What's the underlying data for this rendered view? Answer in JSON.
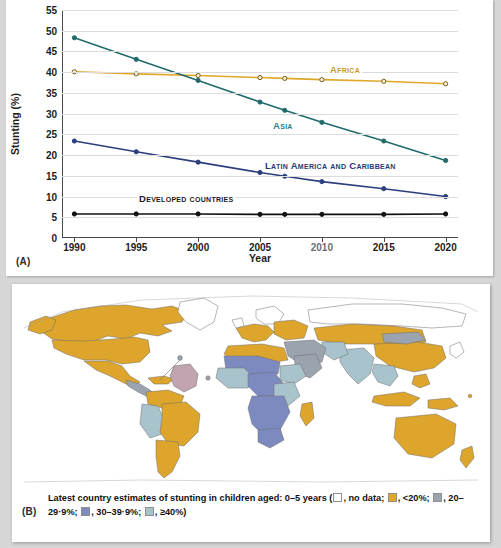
{
  "panel_a": {
    "tag": "(A)",
    "chart_data": {
      "type": "line",
      "title": "",
      "xlabel": "Year",
      "ylabel": "Stunting (%)",
      "x": [
        1990,
        1995,
        2000,
        2005,
        2007,
        2010,
        2015,
        2020
      ],
      "xtick_labels": [
        "1990",
        "1995",
        "2000",
        "2005",
        "2010",
        "2015",
        "2020"
      ],
      "xticks": [
        1990,
        1995,
        2000,
        2005,
        2010,
        2015,
        2020
      ],
      "ytick_labels": [
        "0",
        "5",
        "10",
        "15",
        "20",
        "25",
        "30",
        "35",
        "40",
        "45",
        "50",
        "55"
      ],
      "yticks": [
        0,
        5,
        10,
        15,
        20,
        25,
        30,
        35,
        40,
        45,
        50,
        55
      ],
      "ylim": [
        0,
        55
      ],
      "xlim": [
        1989,
        2021
      ],
      "grid": true,
      "legend": "inline-labels",
      "series": [
        {
          "name": "Africa",
          "color": "#e0a828",
          "label_color": "#c79a28",
          "values": [
            40.1,
            39.6,
            39.2,
            38.7,
            38.5,
            38.2,
            37.8,
            37.2
          ]
        },
        {
          "name": "Asia",
          "color": "#1f6b6b",
          "label_color": "#2d7f86",
          "values": [
            48.3,
            43.1,
            38.0,
            32.8,
            30.8,
            27.9,
            23.4,
            18.7
          ]
        },
        {
          "name": "Latin America and Caribbean",
          "color": "#2b3f7e",
          "label_color": "#273b73",
          "values": [
            23.4,
            20.8,
            18.3,
            15.8,
            14.9,
            13.6,
            11.9,
            10.0
          ]
        },
        {
          "name": "Developed countries",
          "color": "#111111",
          "label_color": "#1a1a1a",
          "values": [
            5.8,
            5.8,
            5.8,
            5.7,
            5.7,
            5.7,
            5.7,
            5.8
          ]
        }
      ],
      "series_label_positions": [
        {
          "name": "Africa",
          "x": 322,
          "y": 64
        },
        {
          "name": "Asia",
          "x": 265,
          "y": 120
        },
        {
          "name": "Latin America and Caribbean",
          "x": 259,
          "y": 160
        },
        {
          "name": "Developed countries",
          "x": 131,
          "y": 193
        }
      ]
    }
  },
  "panel_b": {
    "tag": "(B)",
    "caption": {
      "lead": "Latest country estimates of stunting in children aged: 0–5 years (",
      "items": [
        {
          "swatch": "#ffffff",
          "text": ", no data; "
        },
        {
          "swatch": "#e0a828",
          "text": ", <20%; "
        },
        {
          "swatch": "#9aa3ae",
          "text": ", 20–29·9%; "
        },
        {
          "swatch": "#7d8ac0",
          "text": ", 30–39·9%; "
        },
        {
          "swatch": "#a9c3cc",
          "text": ", ≥40%)"
        }
      ]
    },
    "map": {
      "ocean_color": "#ffffff",
      "border_color": "#6d6d6d",
      "classes": {
        "no_data": "#ffffff",
        "under20": "#dda52c",
        "c20_29": "#9aa3ae",
        "c30_39": "#7d8ac0",
        "over40": "#a9c3cc",
        "highlight": "#c2a3b0"
      }
    }
  }
}
